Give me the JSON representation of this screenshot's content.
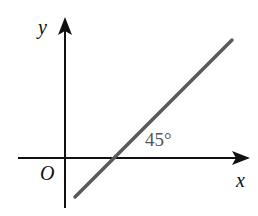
{
  "diagram": {
    "title": "",
    "axes": {
      "x_label": "x",
      "y_label": "y",
      "origin_label": "O"
    },
    "line": {
      "angle_label": "45°",
      "angle_degrees": 45,
      "color": "#555555",
      "description": "Line crossing positive x-axis at 45 degrees"
    },
    "colors": {
      "axes": "#111111",
      "line": "#555555",
      "background": "#ffffff"
    }
  }
}
